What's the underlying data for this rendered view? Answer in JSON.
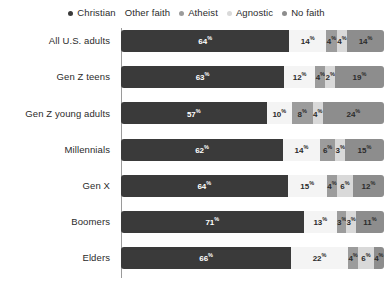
{
  "legend": {
    "items": [
      {
        "label": "Christian",
        "color": "#3a3a3a",
        "icon": "legend-dot"
      },
      {
        "label": "Other faith",
        "color": "#f4f4f4",
        "icon": "legend-dot"
      },
      {
        "label": "Atheist",
        "color": "#9c9c9c",
        "icon": "legend-dot"
      },
      {
        "label": "Agnostic",
        "color": "#d9d9d9",
        "icon": "legend-dot"
      },
      {
        "label": "No faith",
        "color": "#8d8d8d",
        "icon": "legend-dot"
      }
    ]
  },
  "chart_data": {
    "type": "bar",
    "orientation": "horizontal",
    "stacked": true,
    "stack_total": 100,
    "unit": "%",
    "title": "",
    "xlabel": "",
    "ylabel": "",
    "xlim": [
      0,
      100
    ],
    "grid": false,
    "legend_position": "top",
    "categories": [
      "All U.S. adults",
      "Gen Z teens",
      "Gen Z young adults",
      "Millennials",
      "Gen X",
      "Boomers",
      "Elders"
    ],
    "series": [
      {
        "name": "Christian",
        "color": "#3a3a3a",
        "text_color": "#ffffff",
        "values": [
          64,
          63,
          57,
          62,
          64,
          71,
          66
        ]
      },
      {
        "name": "Other faith",
        "color": "#f4f4f4",
        "text_color": "#2b2b2b",
        "values": [
          14,
          12,
          10,
          14,
          15,
          13,
          22
        ]
      },
      {
        "name": "Atheist",
        "color": "#9c9c9c",
        "text_color": "#2b2b2b",
        "values": [
          4,
          4,
          8,
          6,
          4,
          3,
          4
        ]
      },
      {
        "name": "Agnostic",
        "color": "#d9d9d9",
        "text_color": "#2b2b2b",
        "values": [
          4,
          2,
          4,
          3,
          6,
          3,
          6
        ]
      },
      {
        "name": "No faith",
        "color": "#8d8d8d",
        "text_color": "#2b2b2b",
        "values": [
          14,
          19,
          24,
          15,
          12,
          11,
          4
        ]
      }
    ],
    "labels": [
      [
        "64",
        "14",
        "4",
        "4",
        "14"
      ],
      [
        "63",
        "12",
        "4",
        "2",
        "19"
      ],
      [
        "57",
        "10",
        "8",
        "4",
        "24"
      ],
      [
        "62",
        "14",
        "6",
        "3",
        "15"
      ],
      [
        "64",
        "15",
        "4",
        "6",
        "12"
      ],
      [
        "71",
        "13",
        "3",
        "3",
        "11"
      ],
      [
        "66",
        "22",
        "4",
        "6",
        "4"
      ]
    ]
  }
}
